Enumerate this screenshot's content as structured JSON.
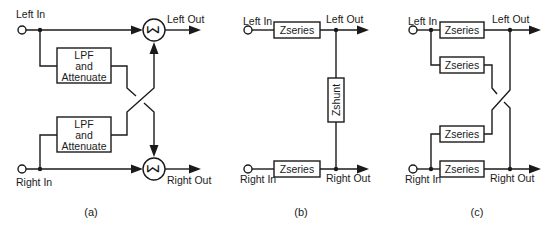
{
  "figure": {
    "panels": [
      {
        "caption": "(a)",
        "labels": {
          "left_in": "Left In",
          "right_in": "Right In",
          "left_out": "Left Out",
          "right_out": "Right Out"
        },
        "blocks": [
          {
            "line1": "LPF",
            "line2": "and",
            "line3": "Attenuate"
          },
          {
            "line1": "LPF",
            "line2": "and",
            "line3": "Attenuate"
          }
        ],
        "summers": [
          {
            "symbol": "Σ"
          },
          {
            "symbol": "Σ"
          }
        ]
      },
      {
        "caption": "(b)",
        "labels": {
          "left_in": "Left In",
          "right_in": "Right In",
          "left_out": "Left Out",
          "right_out": "Right Out"
        },
        "blocks": [
          {
            "label": "Zseries"
          },
          {
            "label": "Zshunt"
          },
          {
            "label": "Zseries"
          }
        ]
      },
      {
        "caption": "(c)",
        "labels": {
          "left_in": "Left In",
          "right_in": "Right In",
          "left_out": "Left Out",
          "right_out": "Right Out"
        },
        "blocks": [
          {
            "label": "Zseries"
          },
          {
            "label": "Zseries"
          },
          {
            "label": "Zseries"
          },
          {
            "label": "Zseries"
          }
        ]
      }
    ]
  }
}
